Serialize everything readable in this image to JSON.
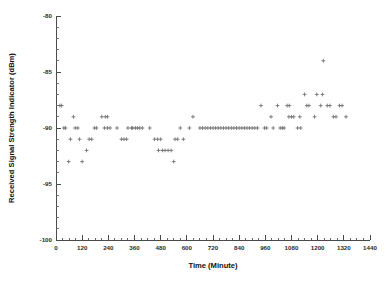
{
  "chart_data": {
    "type": "scatter",
    "title": "",
    "xlabel": "Time (Minute)",
    "ylabel": "Received Signal Strength Indicator (dBm)",
    "xlim": [
      0,
      1440
    ],
    "ylim": [
      -100,
      -80
    ],
    "xticks": [
      0,
      120,
      240,
      360,
      480,
      600,
      720,
      840,
      960,
      1080,
      1200,
      1320,
      1440
    ],
    "xtick_labels": [
      "0",
      "120",
      "240",
      "360",
      "480",
      "600",
      "720",
      "840",
      "960",
      "1080",
      "1200",
      "1320",
      "1440"
    ],
    "yticks": [
      -80,
      -85,
      -90,
      -95,
      -100
    ],
    "ytick_labels": [
      "-80",
      "-85",
      "-90",
      "-95",
      "-100"
    ],
    "x_minor_tick_interval": 30,
    "y_minor_tick_interval": 1,
    "grid": false,
    "legend": null,
    "marker": "plus",
    "marker_color": "#6b6b6b",
    "series": [
      {
        "name": "RSSI samples",
        "points": [
          [
            18,
            -88
          ],
          [
            26,
            -88
          ],
          [
            36,
            -90
          ],
          [
            44,
            -90
          ],
          [
            58,
            -93
          ],
          [
            66,
            -91
          ],
          [
            80,
            -89
          ],
          [
            88,
            -90
          ],
          [
            100,
            -90
          ],
          [
            108,
            -91
          ],
          [
            120,
            -93
          ],
          [
            140,
            -92
          ],
          [
            152,
            -91
          ],
          [
            164,
            -91
          ],
          [
            176,
            -90
          ],
          [
            186,
            -90
          ],
          [
            210,
            -89
          ],
          [
            226,
            -89
          ],
          [
            236,
            -89
          ],
          [
            222,
            -90
          ],
          [
            236,
            -90
          ],
          [
            248,
            -90
          ],
          [
            280,
            -90
          ],
          [
            300,
            -91
          ],
          [
            312,
            -91
          ],
          [
            324,
            -91
          ],
          [
            330,
            -90
          ],
          [
            346,
            -90
          ],
          [
            352,
            -90
          ],
          [
            364,
            -90
          ],
          [
            374,
            -90
          ],
          [
            384,
            -90
          ],
          [
            396,
            -90
          ],
          [
            430,
            -90
          ],
          [
            452,
            -91
          ],
          [
            466,
            -91
          ],
          [
            480,
            -91
          ],
          [
            470,
            -92
          ],
          [
            488,
            -92
          ],
          [
            500,
            -92
          ],
          [
            514,
            -92
          ],
          [
            528,
            -92
          ],
          [
            540,
            -93
          ],
          [
            546,
            -91
          ],
          [
            558,
            -91
          ],
          [
            570,
            -90
          ],
          [
            584,
            -91
          ],
          [
            612,
            -90
          ],
          [
            628,
            -89
          ],
          [
            660,
            -90
          ],
          [
            672,
            -90
          ],
          [
            684,
            -90
          ],
          [
            696,
            -90
          ],
          [
            708,
            -90
          ],
          [
            720,
            -90
          ],
          [
            732,
            -90
          ],
          [
            744,
            -90
          ],
          [
            756,
            -90
          ],
          [
            768,
            -90
          ],
          [
            780,
            -90
          ],
          [
            792,
            -90
          ],
          [
            804,
            -90
          ],
          [
            816,
            -90
          ],
          [
            828,
            -90
          ],
          [
            840,
            -90
          ],
          [
            852,
            -90
          ],
          [
            864,
            -90
          ],
          [
            876,
            -90
          ],
          [
            888,
            -90
          ],
          [
            900,
            -90
          ],
          [
            912,
            -90
          ],
          [
            924,
            -90
          ],
          [
            940,
            -88
          ],
          [
            956,
            -90
          ],
          [
            966,
            -90
          ],
          [
            986,
            -89
          ],
          [
            996,
            -90
          ],
          [
            1016,
            -88
          ],
          [
            1028,
            -90
          ],
          [
            1038,
            -90
          ],
          [
            1046,
            -90
          ],
          [
            1060,
            -88
          ],
          [
            1070,
            -88
          ],
          [
            1068,
            -89
          ],
          [
            1080,
            -89
          ],
          [
            1090,
            -89
          ],
          [
            1108,
            -90
          ],
          [
            1122,
            -90
          ],
          [
            1118,
            -89
          ],
          [
            1140,
            -87
          ],
          [
            1150,
            -88
          ],
          [
            1160,
            -88
          ],
          [
            1186,
            -89
          ],
          [
            1196,
            -87
          ],
          [
            1214,
            -88
          ],
          [
            1222,
            -87
          ],
          [
            1226,
            -84
          ],
          [
            1244,
            -88
          ],
          [
            1256,
            -88
          ],
          [
            1272,
            -89
          ],
          [
            1284,
            -89
          ],
          [
            1300,
            -88
          ],
          [
            1312,
            -88
          ],
          [
            1330,
            -89
          ]
        ]
      }
    ]
  }
}
